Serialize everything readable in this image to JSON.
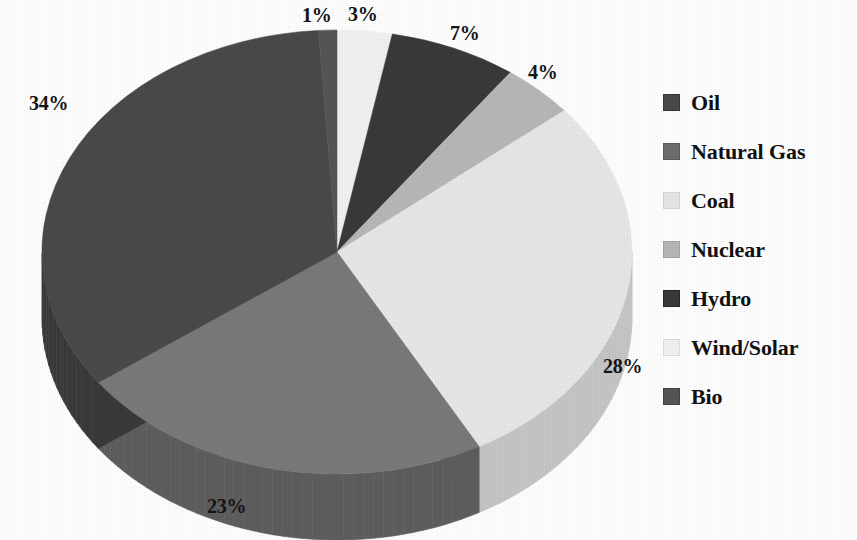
{
  "chart_data": {
    "type": "pie",
    "title": "",
    "subtitle": "",
    "xlabel": "",
    "ylabel": "",
    "style": "3d-exploded-grayscale",
    "legend_position": "right",
    "grid": false,
    "start_angle_deg": 0,
    "direction": "clockwise",
    "labels_format": "percent",
    "categories": [
      "Oil",
      "Natural Gas",
      "Coal",
      "Nuclear",
      "Hydro",
      "Wind/Solar",
      "Bio"
    ],
    "values": [
      34,
      23,
      28,
      4,
      7,
      3,
      1
    ],
    "value_labels": [
      "34%",
      "23%",
      "28%",
      "4%",
      "7%",
      "3%",
      "1%"
    ],
    "colors": [
      "#4a4a4a",
      "#6e6e6e",
      "#e8e8e8",
      "#b8b8b8",
      "#3a3a3a",
      "#f2f2f2",
      "#565656"
    ],
    "slices": [
      {
        "label": "Wind/Solar",
        "value": 3,
        "value_label": "3%",
        "color": "#f2f2f2",
        "side_color": "#d2d2d2"
      },
      {
        "label": "Hydro",
        "value": 7,
        "value_label": "7%",
        "color": "#3a3a3a",
        "side_color": "#2a2a2a"
      },
      {
        "label": "Nuclear",
        "value": 4,
        "value_label": "4%",
        "color": "#b8b8b8",
        "side_color": "#9a9a9a"
      },
      {
        "label": "Coal",
        "value": 28,
        "value_label": "28%",
        "color": "#e8e8e8",
        "side_color": "#c6c6c6"
      },
      {
        "label": "Natural Gas",
        "value": 23,
        "value_label": "23%",
        "color": "#7a7a7a",
        "side_color": "#5e5e5e"
      },
      {
        "label": "Oil",
        "value": 34,
        "value_label": "34%",
        "color": "#4a4a4a",
        "side_color": "#3a3a3a"
      },
      {
        "label": "Bio",
        "value": 1,
        "value_label": "1%",
        "color": "#565656",
        "side_color": "#444444"
      }
    ],
    "total": 100
  },
  "labels": {
    "l1": "1%",
    "l3": "3%",
    "l7": "7%",
    "l4": "4%",
    "l34": "34%",
    "l28": "28%",
    "l23": "23%"
  },
  "legend": {
    "items": [
      {
        "label": "Oil",
        "color": "#4a4a4a"
      },
      {
        "label": "Natural Gas",
        "color": "#6e6e6e"
      },
      {
        "label": "Coal",
        "color": "#e8e8e8"
      },
      {
        "label": "Nuclear",
        "color": "#b8b8b8"
      },
      {
        "label": "Hydro",
        "color": "#3a3a3a"
      },
      {
        "label": "Wind/Solar",
        "color": "#f2f2f2"
      },
      {
        "label": "Bio",
        "color": "#565656"
      }
    ]
  }
}
